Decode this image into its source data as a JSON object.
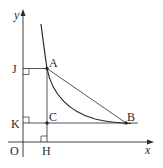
{
  "diagram": {
    "axes": {
      "x_label": "x",
      "y_label": "y",
      "origin_label": "O"
    },
    "points": {
      "A": "A",
      "B": "B",
      "C": "C",
      "H": "H",
      "J": "J",
      "K": "K"
    },
    "colors": {
      "line": "#2a2a2a",
      "background": "#ffffff"
    }
  }
}
